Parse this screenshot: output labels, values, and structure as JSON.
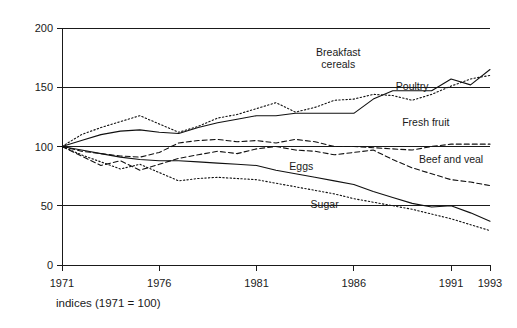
{
  "chart_data": {
    "type": "line",
    "title": "",
    "subtitle": "",
    "caption": "indices (1971 = 100)",
    "xlabel": "",
    "ylabel": "",
    "xlim": [
      1971,
      1993
    ],
    "ylim": [
      0,
      200
    ],
    "grid": true,
    "gridlines_y": [
      0,
      50,
      100,
      150,
      200
    ],
    "legend_position": "inline-annotations",
    "y_ticks": [
      0,
      50,
      100,
      150,
      200
    ],
    "y_tick_labels": [
      "0",
      "50",
      "100",
      "150",
      "200"
    ],
    "x_ticks": [
      1971,
      1976,
      1981,
      1986,
      1991,
      1993
    ],
    "x_tick_labels": [
      "1971",
      "1976",
      "1981",
      "1986",
      "1991",
      "1993"
    ],
    "x": [
      1971,
      1972,
      1973,
      1974,
      1975,
      1976,
      1977,
      1978,
      1979,
      1980,
      1981,
      1982,
      1983,
      1984,
      1985,
      1986,
      1987,
      1988,
      1989,
      1990,
      1991,
      1992,
      1993
    ],
    "series": [
      {
        "name": "Breakfast cereals",
        "style": "solid",
        "label": "Breakfast cereals",
        "label_x": 1985.2,
        "label_y": 176,
        "values": [
          100,
          105,
          110,
          113,
          114,
          112,
          111,
          116,
          120,
          123,
          126,
          126,
          128,
          128,
          128,
          128,
          140,
          147,
          147,
          147,
          157,
          152,
          165
        ]
      },
      {
        "name": "Poultry",
        "style": "dotted",
        "label": "Poultry",
        "label_x": 1989.0,
        "label_y": 148,
        "values": [
          100,
          110,
          116,
          121,
          126,
          119,
          112,
          117,
          124,
          127,
          132,
          137,
          129,
          133,
          139,
          140,
          144,
          143,
          139,
          144,
          151,
          157,
          160
        ]
      },
      {
        "name": "Fresh fruit",
        "style": "dashed",
        "label": "Fresh fruit",
        "label_x": 1989.7,
        "label_y": 117,
        "values": [
          100,
          96,
          94,
          92,
          91,
          95,
          103,
          105,
          106,
          104,
          105,
          103,
          106,
          104,
          100,
          100,
          99,
          98,
          97,
          100,
          102,
          102,
          102
        ]
      },
      {
        "name": "Beef and veal",
        "style": "dashed",
        "label": "Beef and veal",
        "label_x": 1991.0,
        "label_y": 86,
        "values": [
          100,
          92,
          84,
          88,
          80,
          85,
          90,
          93,
          96,
          94,
          98,
          100,
          97,
          96,
          93,
          95,
          97,
          89,
          82,
          77,
          72,
          70,
          67
        ]
      },
      {
        "name": "Eggs",
        "style": "solid",
        "label": "Eggs",
        "label_x": 1983.3,
        "label_y": 80,
        "values": [
          100,
          97,
          94,
          91,
          89,
          88,
          88,
          87,
          86,
          85,
          84,
          80,
          77,
          74,
          71,
          68,
          62,
          57,
          52,
          49,
          50,
          44,
          37
        ]
      },
      {
        "name": "Sugar",
        "style": "dotted",
        "label": "Sugar",
        "label_x": 1984.5,
        "label_y": 48,
        "values": [
          100,
          93,
          87,
          81,
          85,
          78,
          71,
          73,
          74,
          73,
          72,
          69,
          66,
          63,
          60,
          56,
          53,
          50,
          47,
          43,
          39,
          34,
          29
        ]
      }
    ]
  }
}
